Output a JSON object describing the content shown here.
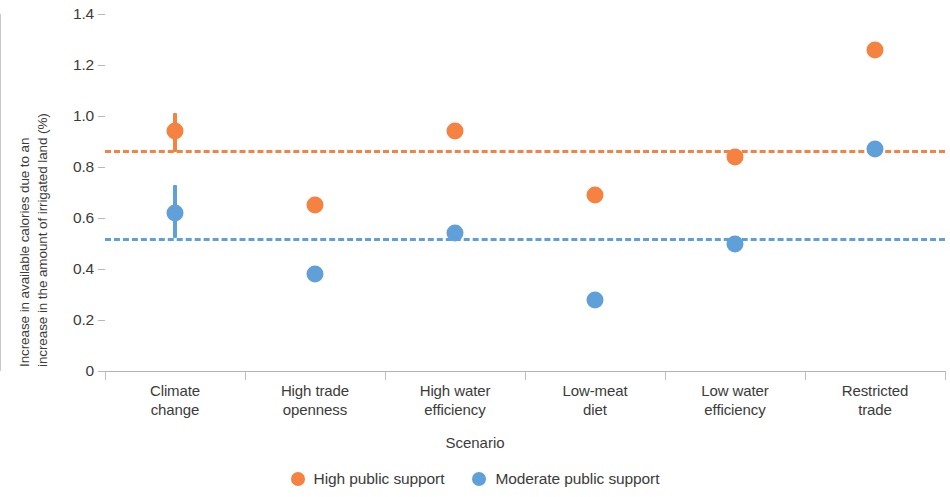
{
  "chart_data": {
    "type": "scatter",
    "title": "",
    "xlabel": "Scenario",
    "ylabel_line1": "Increase in available calories due to an",
    "ylabel_line2": "increase in the amount of irrigated land (%)",
    "categories": [
      "Climate\nchange",
      "High trade\nopenness",
      "High water\nefficiency",
      "Low-meat\ndiet",
      "Low water\nefficiency",
      "Restricted\ntrade"
    ],
    "category_lines": [
      [
        "Climate",
        "change"
      ],
      [
        "High trade",
        "openness"
      ],
      [
        "High water",
        "efficiency"
      ],
      [
        "Low-meat",
        "diet"
      ],
      [
        "Low water",
        "efficiency"
      ],
      [
        "Restricted",
        "trade"
      ]
    ],
    "ylim": [
      0,
      1.4
    ],
    "ytick_labels": [
      "1.4",
      "1.2",
      "1.0",
      "0.8",
      "0.6",
      "0.4",
      "0.2",
      "0"
    ],
    "ytick_values": [
      1.4,
      1.2,
      1.0,
      0.8,
      0.6,
      0.4,
      0.2,
      0
    ],
    "grid": false,
    "legend_position": "bottom-center",
    "series": [
      {
        "name": "High public support",
        "color": "#f58240",
        "values": [
          0.94,
          0.65,
          0.94,
          0.69,
          0.84,
          1.26
        ],
        "err_low": [
          0.86,
          0.65,
          0.94,
          0.69,
          0.84,
          1.26
        ],
        "err_high": [
          1.01,
          0.65,
          0.94,
          0.69,
          0.84,
          1.26
        ],
        "reference_line": 0.865
      },
      {
        "name": "Moderate public support",
        "color": "#60a0d8",
        "values": [
          0.62,
          0.38,
          0.54,
          0.28,
          0.5,
          0.87
        ],
        "err_low": [
          0.52,
          0.38,
          0.54,
          0.25,
          0.5,
          0.87
        ],
        "err_high": [
          0.73,
          0.38,
          0.54,
          0.31,
          0.5,
          0.87
        ],
        "reference_line": 0.52
      }
    ]
  },
  "legend": {
    "items": [
      {
        "label": "High public support",
        "color": "#f58240"
      },
      {
        "label": "Moderate public support",
        "color": "#60a0d8"
      }
    ]
  }
}
